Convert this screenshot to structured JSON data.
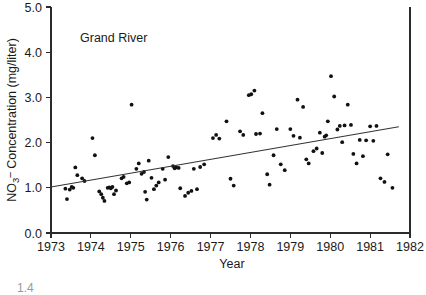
{
  "figure": {
    "annotation": "Grand River",
    "fragment_below": "1.4"
  },
  "axes": {
    "x_title": "Year",
    "y_title_prefix": "NO",
    "y_title_sub": "3",
    "y_title_sup": "–",
    "y_title_rest": " Concentration (mg/liter)",
    "y_title_full": "NO3- Concentration (mg/liter)",
    "x_ticks": [
      "1973",
      "1974",
      "1975",
      "1976",
      "1977",
      "1978",
      "1979",
      "1980",
      "1981",
      "1982"
    ],
    "y_ticks": [
      "0.0",
      "1.0",
      "2.0",
      "3.0",
      "4.0",
      "5.0"
    ]
  },
  "chart_data": {
    "type": "scatter",
    "title": "",
    "annotation": "Grand River",
    "xlabel": "Year",
    "ylabel": "NO3- Concentration (mg/liter)",
    "xlim": [
      1973,
      1982
    ],
    "ylim": [
      0.0,
      5.0
    ],
    "xticks": [
      1973,
      1974,
      1975,
      1976,
      1977,
      1978,
      1979,
      1980,
      1981,
      1982
    ],
    "yticks": [
      0.0,
      1.0,
      2.0,
      3.0,
      4.0,
      5.0
    ],
    "grid": false,
    "legend": "none",
    "marker": "filled-circle",
    "series": [
      {
        "name": "Grand River NO3 samples",
        "points": [
          [
            1973.36,
            0.98
          ],
          [
            1973.4,
            0.75
          ],
          [
            1973.47,
            0.96
          ],
          [
            1973.52,
            1.02
          ],
          [
            1973.56,
            1.0
          ],
          [
            1973.61,
            1.45
          ],
          [
            1973.66,
            1.28
          ],
          [
            1973.78,
            1.21
          ],
          [
            1973.84,
            1.15
          ],
          [
            1974.04,
            2.1
          ],
          [
            1974.1,
            1.72
          ],
          [
            1974.21,
            0.92
          ],
          [
            1974.26,
            0.86
          ],
          [
            1974.3,
            0.78
          ],
          [
            1974.34,
            0.71
          ],
          [
            1974.42,
            1.0
          ],
          [
            1974.46,
            1.01
          ],
          [
            1974.5,
            0.99
          ],
          [
            1974.54,
            1.02
          ],
          [
            1974.58,
            0.86
          ],
          [
            1974.63,
            0.94
          ],
          [
            1974.77,
            1.21
          ],
          [
            1974.82,
            1.24
          ],
          [
            1974.9,
            1.1
          ],
          [
            1974.96,
            1.12
          ],
          [
            1975.02,
            2.84
          ],
          [
            1975.14,
            1.42
          ],
          [
            1975.2,
            1.54
          ],
          [
            1975.27,
            1.31
          ],
          [
            1975.33,
            1.35
          ],
          [
            1975.36,
            0.91
          ],
          [
            1975.4,
            0.74
          ],
          [
            1975.45,
            1.6
          ],
          [
            1975.52,
            1.22
          ],
          [
            1975.58,
            0.97
          ],
          [
            1975.64,
            1.05
          ],
          [
            1975.7,
            1.12
          ],
          [
            1975.8,
            1.42
          ],
          [
            1975.86,
            1.18
          ],
          [
            1975.94,
            1.68
          ],
          [
            1976.06,
            1.48
          ],
          [
            1976.1,
            1.43
          ],
          [
            1976.14,
            1.45
          ],
          [
            1976.2,
            1.44
          ],
          [
            1976.24,
            0.99
          ],
          [
            1976.36,
            0.82
          ],
          [
            1976.44,
            0.89
          ],
          [
            1976.52,
            0.93
          ],
          [
            1976.58,
            1.42
          ],
          [
            1976.66,
            0.97
          ],
          [
            1976.74,
            1.46
          ],
          [
            1976.84,
            1.52
          ],
          [
            1977.06,
            2.1
          ],
          [
            1977.14,
            2.17
          ],
          [
            1977.22,
            2.09
          ],
          [
            1977.4,
            2.47
          ],
          [
            1977.5,
            1.2
          ],
          [
            1977.58,
            1.05
          ],
          [
            1977.74,
            2.25
          ],
          [
            1977.82,
            2.17
          ],
          [
            1977.96,
            3.05
          ],
          [
            1978.02,
            3.07
          ],
          [
            1978.1,
            3.15
          ],
          [
            1978.14,
            2.19
          ],
          [
            1978.24,
            2.2
          ],
          [
            1978.3,
            2.65
          ],
          [
            1978.42,
            1.3
          ],
          [
            1978.48,
            1.07
          ],
          [
            1978.58,
            1.72
          ],
          [
            1978.66,
            2.3
          ],
          [
            1978.76,
            1.52
          ],
          [
            1978.86,
            1.39
          ],
          [
            1979.0,
            2.3
          ],
          [
            1979.08,
            2.15
          ],
          [
            1979.18,
            2.95
          ],
          [
            1979.24,
            2.11
          ],
          [
            1979.32,
            2.79
          ],
          [
            1979.4,
            1.63
          ],
          [
            1979.46,
            1.54
          ],
          [
            1979.58,
            1.81
          ],
          [
            1979.66,
            1.87
          ],
          [
            1979.74,
            2.22
          ],
          [
            1979.8,
            1.77
          ],
          [
            1979.86,
            2.13
          ],
          [
            1979.9,
            2.16
          ],
          [
            1979.94,
            2.47
          ],
          [
            1980.02,
            3.47
          ],
          [
            1980.1,
            3.02
          ],
          [
            1980.18,
            2.29
          ],
          [
            1980.24,
            2.37
          ],
          [
            1980.3,
            2.01
          ],
          [
            1980.36,
            2.38
          ],
          [
            1980.44,
            2.84
          ],
          [
            1980.52,
            2.39
          ],
          [
            1980.58,
            1.75
          ],
          [
            1980.66,
            1.54
          ],
          [
            1980.74,
            2.06
          ],
          [
            1980.82,
            1.7
          ],
          [
            1980.9,
            2.05
          ],
          [
            1981.0,
            2.36
          ],
          [
            1981.08,
            2.04
          ],
          [
            1981.16,
            2.37
          ],
          [
            1981.26,
            1.21
          ],
          [
            1981.36,
            1.13
          ],
          [
            1981.44,
            1.74
          ],
          [
            1981.56,
            1.0
          ]
        ]
      }
    ],
    "trend_line": {
      "name": "linear regression",
      "x_start": 1973.0,
      "y_start": 1.02,
      "x_end": 1981.72,
      "y_end": 2.35
    }
  }
}
